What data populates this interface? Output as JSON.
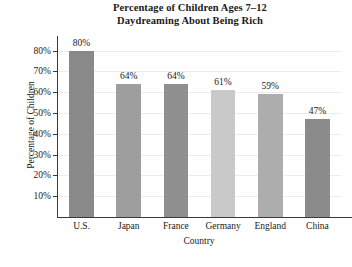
{
  "chart_data": {
    "type": "bar",
    "title": "Percentage of Children Ages 7–12 Daydreaming About Being Rich",
    "title_lines": [
      "Percentage of Children Ages 7–12",
      "Daydreaming About Being Rich"
    ],
    "xlabel": "Country",
    "ylabel": "Percentage of Children",
    "categories": [
      "U.S.",
      "Japan",
      "France",
      "Germany",
      "England",
      "China"
    ],
    "values": [
      80,
      64,
      64,
      61,
      59,
      47
    ],
    "value_labels": [
      "80%",
      "64%",
      "64%",
      "61%",
      "59%",
      "47%"
    ],
    "bar_colors": [
      "#898989",
      "#9e9e9e",
      "#8f8f8f",
      "#c9c9c9",
      "#adadad",
      "#8b8b8b"
    ],
    "ylim": [
      0,
      87
    ],
    "yticks": [
      10,
      20,
      30,
      40,
      50,
      60,
      70,
      80
    ],
    "ytick_labels": [
      "10%",
      "20%",
      "30%",
      "40%",
      "50%",
      "60%",
      "70%",
      "80%"
    ],
    "grid": true,
    "grid_color": "#ececec",
    "legend": null,
    "axis_color": "#3a3a3a",
    "background": "#ffffff"
  }
}
